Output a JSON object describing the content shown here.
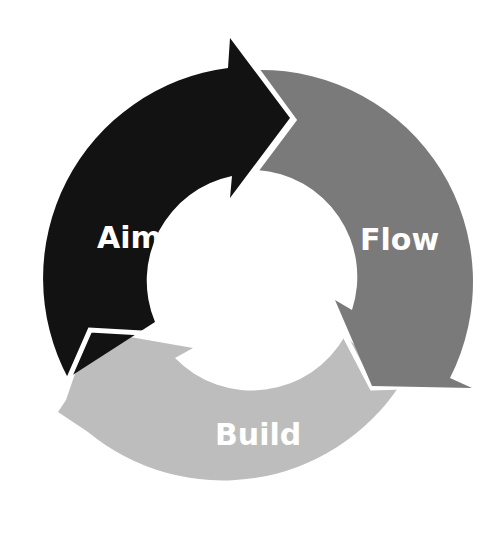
{
  "diagram": {
    "type": "cycle",
    "segments": [
      {
        "label": "Aim",
        "color": "#121212"
      },
      {
        "label": "Flow",
        "color": "#7a7a7a"
      },
      {
        "label": "Build",
        "color": "#bdbdbd"
      }
    ]
  }
}
